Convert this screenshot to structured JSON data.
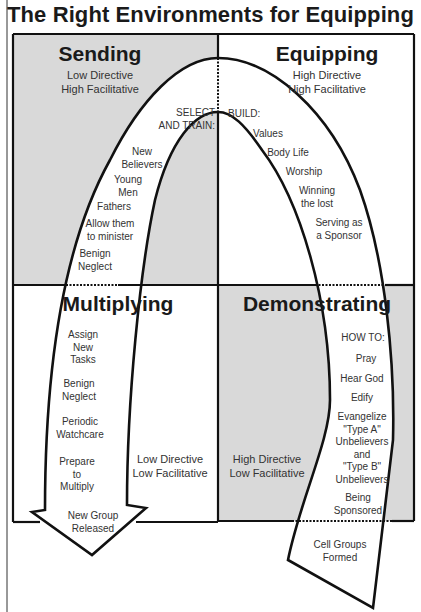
{
  "title": "The Right Environments for Equipping",
  "colors": {
    "shaded_quadrant": "#d9d9d9",
    "line": "#111111",
    "background": "#ffffff"
  },
  "quadrants": {
    "sending": {
      "title": "Sending",
      "line1": "Low Directive",
      "line2": "High Facilitative",
      "shaded": true
    },
    "equipping": {
      "title": "Equipping",
      "line1": "High Directive",
      "line2": "High Facilitative",
      "shaded": false
    },
    "multiplying": {
      "title": "Multiplying",
      "line1": "Low Directive",
      "line2": "Low Facilitative",
      "shaded": false
    },
    "demonstrating": {
      "title": "Demonstrating",
      "line1": "High Directive",
      "line2": "Low Facilitative",
      "shaded": true
    }
  },
  "path": {
    "select_and_train": {
      "heading": [
        "SELECT",
        "AND TRAIN:"
      ],
      "items": [
        [
          "New",
          "Believers"
        ],
        [
          "Young",
          "Men"
        ],
        [
          "Fathers"
        ],
        [
          "Allow them",
          "to minister"
        ],
        [
          "Benign",
          "Neglect"
        ]
      ]
    },
    "build": {
      "heading": "BUILD:",
      "items": [
        [
          "Values"
        ],
        [
          "Body Life"
        ],
        [
          "Worship"
        ],
        [
          "Winning",
          "the lost"
        ],
        [
          "Serving as",
          "a Sponsor"
        ]
      ]
    },
    "how_to": {
      "heading": "HOW TO:",
      "items": [
        [
          "Pray"
        ],
        [
          "Hear God"
        ],
        [
          "Edify"
        ],
        [
          "Evangelize",
          "\"Type A\"",
          "Unbelievers",
          "and",
          "\"Type B\"",
          "Unbelievers"
        ],
        [
          "Being",
          "Sponsored"
        ]
      ]
    },
    "start": [
      "Cell Groups",
      "Formed"
    ],
    "multiplying_steps": {
      "items": [
        [
          "Assign",
          "New",
          "Tasks"
        ],
        [
          "Benign",
          "Neglect"
        ],
        [
          "Periodic",
          "Watchcare"
        ],
        [
          "Prepare",
          "to",
          "Multiply"
        ]
      ]
    },
    "end": [
      "New Group",
      "Released"
    ]
  }
}
